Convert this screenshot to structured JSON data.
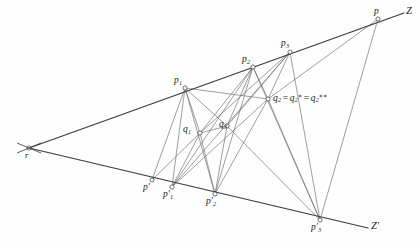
{
  "figure": {
    "background_color": "#fefefe",
    "axis_color": "#3b3b42",
    "connector_color": "#6a6a72",
    "marker_color": "#3a3a40",
    "width": 419,
    "height": 247
  },
  "labels": {
    "r": "r",
    "p": "p",
    "Z": "Z",
    "Zprime": "Z′",
    "p1": "p",
    "p1_sub": "1",
    "p2": "p",
    "p2_sub": "2",
    "p3": "p",
    "p3_sub": "3",
    "pprime": "p′",
    "p1prime": "p′",
    "p1prime_sub": "1",
    "p2prime": "p′",
    "p2prime_sub": "2",
    "p3prime": "p′",
    "p3prime_sub": "3",
    "q1": "q",
    "q1_sub": "1",
    "q3": "q",
    "q3_sub": "3",
    "q2_full_base": "q",
    "q2_full_sub": "2",
    "q2_eq1": "=",
    "q2_star_base": "q",
    "q2_star_sub": "2",
    "q2_star_sup": "∗",
    "q2_eq2": "=",
    "q2_dstar_base": "q",
    "q2_dstar_sub": "2",
    "q2_dstar_sup": "∗∗"
  },
  "points": {
    "r": {
      "x": 29,
      "y": 148,
      "marker": "cross"
    },
    "p1": {
      "x": 185,
      "y": 88,
      "marker": "circle"
    },
    "p2": {
      "x": 253,
      "y": 67,
      "marker": "circle"
    },
    "p3": {
      "x": 290,
      "y": 52,
      "marker": "circle"
    },
    "p": {
      "x": 378,
      "y": 19,
      "marker": "circle"
    },
    "Zend": {
      "x": 404,
      "y": 13,
      "marker": "none"
    },
    "pprime": {
      "x": 152,
      "y": 180,
      "marker": "circle"
    },
    "p1prime": {
      "x": 172,
      "y": 187,
      "marker": "circle"
    },
    "p2prime": {
      "x": 215,
      "y": 194,
      "marker": "circle"
    },
    "p3prime": {
      "x": 320,
      "y": 220,
      "marker": "circle"
    },
    "Zpend": {
      "x": 368,
      "y": 228,
      "marker": "none"
    },
    "q1": {
      "x": 200,
      "y": 133,
      "marker": "circle"
    },
    "q3": {
      "x": 227,
      "y": 126,
      "marker": "circle"
    },
    "q2": {
      "x": 268,
      "y": 99,
      "marker": "circle"
    }
  },
  "axis_lines": [
    {
      "name": "line-Z",
      "from": "r",
      "to": "Zend"
    },
    {
      "name": "line-Zprime",
      "from": "r",
      "to": "Zpend"
    }
  ],
  "connectors": [
    {
      "name": "p1-q1",
      "from": "p1",
      "to": "q1"
    },
    {
      "name": "p1-p1prime",
      "from": "p1",
      "to": "p1prime"
    },
    {
      "name": "p1-q3",
      "from": "p1",
      "to": "q3"
    },
    {
      "name": "p1-q2",
      "from": "p1",
      "to": "q2"
    },
    {
      "name": "p1-p2prime",
      "from": "p1",
      "to": "p2prime"
    },
    {
      "name": "p2-q1",
      "from": "p2",
      "to": "q1"
    },
    {
      "name": "p2-p1prime",
      "from": "p2",
      "to": "p1prime"
    },
    {
      "name": "p2-q3",
      "from": "p2",
      "to": "q3"
    },
    {
      "name": "p2-p2prime",
      "from": "p2",
      "to": "p2prime"
    },
    {
      "name": "p2-q2",
      "from": "p2",
      "to": "q2"
    },
    {
      "name": "p2-p3prime",
      "from": "p2",
      "to": "p3prime"
    },
    {
      "name": "p3-q2",
      "from": "p3",
      "to": "q2"
    },
    {
      "name": "p3-q3",
      "from": "p3",
      "to": "q3"
    },
    {
      "name": "p3-q1",
      "from": "p3",
      "to": "q1"
    },
    {
      "name": "p3-p1prime",
      "from": "p3",
      "to": "p1prime"
    },
    {
      "name": "p3-p3prime",
      "from": "p3",
      "to": "p3prime"
    },
    {
      "name": "p-q2",
      "from": "p",
      "to": "q2"
    },
    {
      "name": "p-p3prime",
      "from": "p",
      "to": "p3prime"
    },
    {
      "name": "q2-p1prime",
      "from": "q2",
      "to": "p1prime"
    },
    {
      "name": "q2-p2prime",
      "from": "q2",
      "to": "p2prime"
    },
    {
      "name": "q2-p3prime",
      "from": "q2",
      "to": "p3prime"
    },
    {
      "name": "q1-q3",
      "from": "q1",
      "to": "q3"
    },
    {
      "name": "q3-p2prime",
      "from": "q3",
      "to": "p2prime"
    },
    {
      "name": "q3-p3prime",
      "from": "q3",
      "to": "p3prime"
    },
    {
      "name": "q1-p1prime",
      "from": "q1",
      "to": "p1prime"
    },
    {
      "name": "q1-p2prime",
      "from": "q1",
      "to": "p2prime"
    },
    {
      "name": "pprime-q1",
      "from": "pprime",
      "to": "q1"
    },
    {
      "name": "pprime-p1",
      "from": "pprime",
      "to": "p1"
    }
  ]
}
